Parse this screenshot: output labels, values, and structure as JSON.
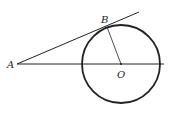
{
  "diagram": {
    "labels": {
      "A": "A",
      "B": "B",
      "O": "O"
    },
    "colors": {
      "stroke": "#222222",
      "background": "#ffffff"
    },
    "points": {
      "A": [
        17,
        64
      ],
      "B": [
        107,
        27
      ],
      "O": [
        121,
        64
      ]
    },
    "circle": {
      "center": "O",
      "radius": 39
    }
  }
}
